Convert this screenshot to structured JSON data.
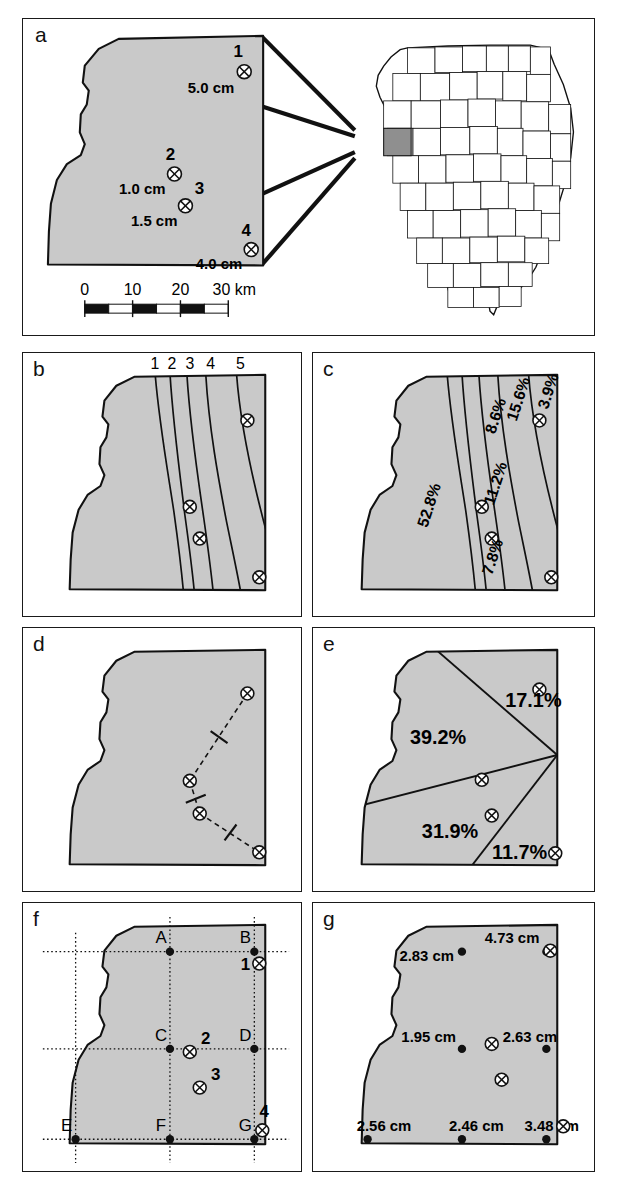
{
  "figure": {
    "caption_absent": true,
    "region_name": "study-watershed",
    "fill_color": "#c9c9c9",
    "line_color": "#111111"
  },
  "panels": {
    "a": {
      "label": "a",
      "scalebar": {
        "ticks": [
          "0",
          "10",
          "20",
          "30 km"
        ],
        "unit": "km",
        "max_km": 30
      },
      "gauges": [
        {
          "id": "1",
          "value": "5.0 cm",
          "number": "1"
        },
        {
          "id": "2",
          "value": "1.0 cm",
          "number": "2"
        },
        {
          "id": "3",
          "value": "1.5 cm",
          "number": "3"
        },
        {
          "id": "4",
          "value": "4.0 cm",
          "number": "4"
        }
      ],
      "inset": {
        "state": "Illinois",
        "highlighted": true
      }
    },
    "b": {
      "label": "b",
      "isohyet_labels": [
        "1",
        "2",
        "3",
        "4",
        "5"
      ]
    },
    "c": {
      "label": "c",
      "area_percentages": [
        "52.8%",
        "11.2%",
        "8.6%",
        "15.6%",
        "3.9%",
        "7.8%"
      ],
      "bands": [
        {
          "name": "band-west",
          "pct": "52.8%"
        },
        {
          "name": "band-2",
          "pct": "11.2%"
        },
        {
          "name": "band-3",
          "pct": "8.6%"
        },
        {
          "name": "band-4",
          "pct": "15.6%"
        },
        {
          "name": "band-east",
          "pct": "3.9%"
        },
        {
          "name": "band-south",
          "pct": "7.8%"
        }
      ]
    },
    "d": {
      "label": "d",
      "construction": "thiessen-connectors-with-bisector-ticks",
      "tick_count": 3
    },
    "e": {
      "label": "e",
      "polygons": [
        {
          "name": "polygon-gauge-1",
          "pct": "17.1%"
        },
        {
          "name": "polygon-gauge-2",
          "pct": "39.2%"
        },
        {
          "name": "polygon-gauge-3",
          "pct": "31.9%"
        },
        {
          "name": "polygon-gauge-4",
          "pct": "11.7%"
        }
      ]
    },
    "f": {
      "label": "f",
      "nodes": [
        "A",
        "B",
        "C",
        "D",
        "E",
        "F",
        "G"
      ],
      "gauge_numbers": [
        "1",
        "2",
        "3",
        "4"
      ]
    },
    "g": {
      "label": "g",
      "node_values": [
        {
          "node": "A",
          "value": "2.83 cm"
        },
        {
          "node": "B",
          "value": "4.73 cm"
        },
        {
          "node": "C",
          "value": "1.95 cm"
        },
        {
          "node": "D",
          "value": "2.63 cm"
        },
        {
          "node": "E",
          "value": "2.56 cm"
        },
        {
          "node": "F",
          "value": "2.46 cm"
        },
        {
          "node": "G",
          "value": "3.48 cm"
        }
      ]
    }
  }
}
